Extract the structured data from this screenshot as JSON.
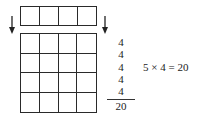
{
  "strip": {
    "columns": 4,
    "rows": 1
  },
  "grid": {
    "columns": 4,
    "rows": 4
  },
  "arrows": [
    {
      "position": "left",
      "icon": "arrow-down-icon"
    },
    {
      "position": "right",
      "icon": "arrow-down-icon"
    }
  ],
  "sum": {
    "addends": [
      "4",
      "4",
      "4",
      "4",
      "4"
    ],
    "total": "20"
  },
  "equation": {
    "text": "5 × 4 = 20"
  }
}
